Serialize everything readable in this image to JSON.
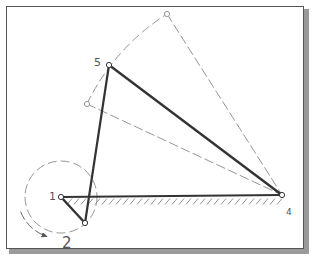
{
  "diagram": {
    "colors": {
      "link": "#333333",
      "construction": "#8a8a8a",
      "label": "#555555",
      "frame_border": "#555555",
      "frame_shadow": "#9a9a9a"
    },
    "labels": {
      "ground_pivot_crank": "1",
      "rotation": "2",
      "ground_pivot_rocker": "4",
      "coupler_joint": "5"
    },
    "points": {
      "p1": {
        "x": 61,
        "y": 197
      },
      "crank_end": {
        "x": 85,
        "y": 223
      },
      "p5": {
        "x": 109,
        "y": 65
      },
      "p4": {
        "x": 282,
        "y": 195
      },
      "rocker_alt_top": {
        "x": 167,
        "y": 14
      },
      "rocker_alt_low": {
        "x": 87,
        "y": 104
      }
    },
    "crank_circle_radius": 36,
    "rotation_direction": "clockwise"
  }
}
